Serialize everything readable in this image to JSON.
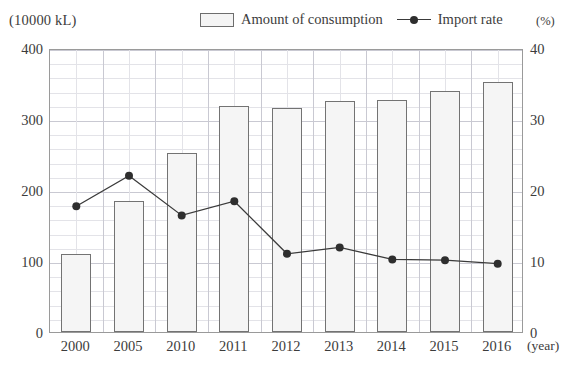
{
  "header": {
    "left_unit": "(10000 kL)",
    "right_unit": "(%)"
  },
  "legend": {
    "items": [
      {
        "label": "Amount of consumption",
        "marker": "bar-swatch-icon",
        "color": "#f4f4f4"
      },
      {
        "label": "Import rate",
        "marker": "line-dot-icon",
        "color": "#2e2e2e"
      }
    ]
  },
  "axes": {
    "x_unit_label": "(year)",
    "left_ticks": [
      "400",
      "300",
      "200",
      "100",
      "0"
    ],
    "right_ticks": [
      "40",
      "30",
      "20",
      "10",
      "0"
    ]
  },
  "chart_data": {
    "type": "bar",
    "title": "",
    "subtitle": "",
    "xlabel": "(year)",
    "ylabel": "(10000 kL)",
    "y2label": "(%)",
    "categories": [
      "2000",
      "2005",
      "2010",
      "2011",
      "2012",
      "2013",
      "2014",
      "2015",
      "2016"
    ],
    "series": [
      {
        "name": "Amount of consumption",
        "type": "bar",
        "axis": "left",
        "unit": "10000 kL",
        "values": [
          110,
          184,
          252,
          319,
          315,
          326,
          327,
          339,
          352
        ]
      },
      {
        "name": "Import rate",
        "type": "line",
        "axis": "right",
        "unit": "%",
        "values": [
          18.0,
          22.3,
          16.7,
          18.7,
          11.3,
          12.2,
          10.5,
          10.4,
          9.9
        ]
      }
    ],
    "ylim": [
      0,
      400
    ],
    "y2lim": [
      0,
      40
    ],
    "ytick_step": 100,
    "y2tick_step": 10,
    "grid": true,
    "grid_minor_step": 20,
    "legend_position": "top"
  }
}
